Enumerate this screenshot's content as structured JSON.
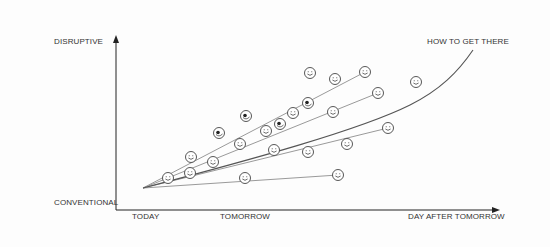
{
  "diagram": {
    "y_axis": {
      "top_label": "DISRUPTIVE",
      "bottom_label": "CONVENTIONAL"
    },
    "x_axis": {
      "labels": [
        "TODAY",
        "TOMORROW",
        "DAY AFTER TOMORROW"
      ]
    },
    "curve_label": "HOW TO GET THERE",
    "colors": {
      "axis": "#222222",
      "line": "#9a9a9a",
      "curve": "#555555",
      "face": "#444444"
    },
    "origin": [
      143,
      188
    ],
    "rays": [
      {
        "end": [
          365,
          72
        ]
      },
      {
        "end": [
          378,
          93
        ]
      },
      {
        "end": [
          388,
          128
        ]
      },
      {
        "end": [
          338,
          175
        ]
      }
    ],
    "faces": [
      {
        "x": 168,
        "y": 178,
        "type": "smile"
      },
      {
        "x": 191,
        "y": 157,
        "type": "smile"
      },
      {
        "x": 190,
        "y": 173,
        "type": "smile"
      },
      {
        "x": 213,
        "y": 162,
        "type": "smile"
      },
      {
        "x": 219,
        "y": 133,
        "type": "eye"
      },
      {
        "x": 240,
        "y": 144,
        "type": "smile"
      },
      {
        "x": 246,
        "y": 116,
        "type": "eye"
      },
      {
        "x": 245,
        "y": 178,
        "type": "smile"
      },
      {
        "x": 266,
        "y": 131,
        "type": "smile"
      },
      {
        "x": 274,
        "y": 150,
        "type": "smile"
      },
      {
        "x": 280,
        "y": 124,
        "type": "eye"
      },
      {
        "x": 293,
        "y": 113,
        "type": "smile"
      },
      {
        "x": 308,
        "y": 103,
        "type": "eye"
      },
      {
        "x": 308,
        "y": 152,
        "type": "smile"
      },
      {
        "x": 310,
        "y": 73,
        "type": "smile"
      },
      {
        "x": 335,
        "y": 79,
        "type": "smile"
      },
      {
        "x": 333,
        "y": 112,
        "type": "smile"
      },
      {
        "x": 338,
        "y": 175,
        "type": "smile"
      },
      {
        "x": 347,
        "y": 144,
        "type": "smile"
      },
      {
        "x": 365,
        "y": 72,
        "type": "smile"
      },
      {
        "x": 378,
        "y": 93,
        "type": "smile"
      },
      {
        "x": 388,
        "y": 128,
        "type": "smile"
      },
      {
        "x": 416,
        "y": 82,
        "type": "smile"
      }
    ]
  }
}
